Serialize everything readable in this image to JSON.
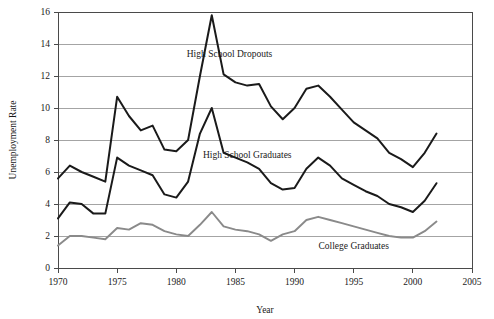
{
  "chart_data": {
    "type": "line",
    "title": "",
    "xlabel": "Year",
    "ylabel": "Unemployment Rate",
    "xlim": [
      1970,
      2005
    ],
    "ylim": [
      0,
      16
    ],
    "xticks": [
      1970,
      1975,
      1980,
      1985,
      1990,
      1995,
      2000,
      2005
    ],
    "yticks": [
      0,
      2,
      4,
      6,
      8,
      10,
      12,
      14,
      16
    ],
    "grid": "horizontal",
    "legend": "inline-annotations",
    "x": [
      1970,
      1971,
      1972,
      1973,
      1974,
      1975,
      1976,
      1977,
      1978,
      1979,
      1980,
      1981,
      1982,
      1983,
      1984,
      1985,
      1986,
      1987,
      1988,
      1989,
      1990,
      1991,
      1992,
      1993,
      1994,
      1995,
      1996,
      1997,
      1998,
      1999,
      2000,
      2001,
      2002
    ],
    "series": [
      {
        "name": "High School Dropouts",
        "color": "#1a1a1a",
        "values": [
          5.6,
          6.4,
          6.0,
          5.7,
          5.4,
          10.7,
          9.5,
          8.6,
          8.9,
          7.4,
          7.3,
          8.0,
          12.0,
          15.8,
          12.1,
          11.6,
          11.4,
          11.5,
          10.1,
          9.3,
          10.0,
          11.2,
          11.4,
          10.7,
          9.9,
          9.1,
          8.6,
          8.1,
          7.2,
          6.8,
          6.3,
          7.2,
          8.4
        ]
      },
      {
        "name": "High School Graduates",
        "color": "#1a1a1a",
        "values": [
          3.1,
          4.1,
          4.0,
          3.4,
          3.4,
          6.9,
          6.4,
          6.1,
          5.8,
          4.6,
          4.4,
          5.4,
          8.4,
          10.0,
          7.2,
          6.9,
          6.6,
          6.2,
          5.3,
          4.9,
          5.0,
          6.2,
          6.9,
          6.4,
          5.6,
          5.2,
          4.8,
          4.5,
          4.0,
          3.8,
          3.5,
          4.2,
          5.3
        ]
      },
      {
        "name": "College Graduates",
        "color": "#8a8a8a",
        "values": [
          1.4,
          2.0,
          2.0,
          1.9,
          1.8,
          2.5,
          2.4,
          2.8,
          2.7,
          2.3,
          2.1,
          2.0,
          2.7,
          3.5,
          2.6,
          2.4,
          2.3,
          2.1,
          1.7,
          2.1,
          2.3,
          3.0,
          3.2,
          3.0,
          2.8,
          2.6,
          2.4,
          2.2,
          2.0,
          1.9,
          1.9,
          2.3,
          2.9
        ]
      }
    ],
    "annotations": [
      {
        "label": "High School Dropouts",
        "x": 1984.5,
        "y": 13.2
      },
      {
        "label": "High School Graduates",
        "x": 1986.0,
        "y": 6.9
      },
      {
        "label": "College Graduates",
        "x": 1995.0,
        "y": 1.2
      }
    ]
  }
}
